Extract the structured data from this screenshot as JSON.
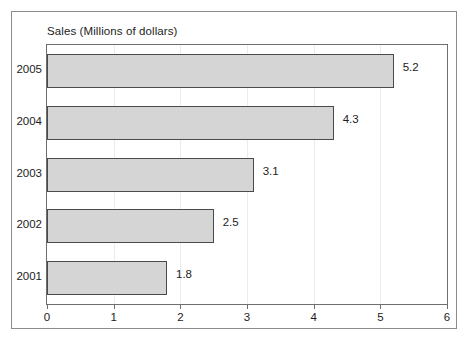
{
  "chart_data": {
    "type": "bar",
    "orientation": "horizontal",
    "title": "Sales (Millions of dollars)",
    "xlabel": "",
    "ylabel": "",
    "categories": [
      "2005",
      "2004",
      "2003",
      "2002",
      "2001"
    ],
    "values": [
      5.2,
      4.3,
      3.1,
      2.5,
      1.8
    ],
    "value_labels": [
      "5.2",
      "4.3",
      "3.1",
      "2.5",
      "1.8"
    ],
    "xlim": [
      0,
      6
    ],
    "xticks": [
      0,
      1,
      2,
      3,
      4,
      5,
      6
    ],
    "xtick_labels": [
      "0",
      "1",
      "2",
      "3",
      "4",
      "5",
      "6"
    ],
    "grid": true,
    "grid_axis": "x",
    "legend": false,
    "series": [
      {
        "name": "Sales",
        "values": [
          5.2,
          4.3,
          3.1,
          2.5,
          1.8
        ]
      }
    ],
    "colors": {
      "bar_fill": "#d5d5d5",
      "bar_stroke": "#4a4a4a",
      "frame": "#6e6e6e",
      "gridline": "#ececec",
      "figure_border": "#8c8c8c",
      "text": "#1c1c1c",
      "background": "#ffffff"
    }
  }
}
